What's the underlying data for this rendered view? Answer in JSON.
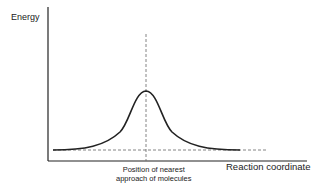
{
  "diagram": {
    "y_axis_label": "Energy",
    "x_axis_label": "Reaction coordinate",
    "peak_annotation": [
      "Position of nearest",
      "approach of molecules"
    ],
    "curve_type": "single-peak energy barrier",
    "guides": [
      "vertical dashed line through peak",
      "horizontal dashed baseline"
    ],
    "colors": {
      "line": "#222222",
      "dashed": "#666666",
      "background": "#ffffff"
    }
  }
}
